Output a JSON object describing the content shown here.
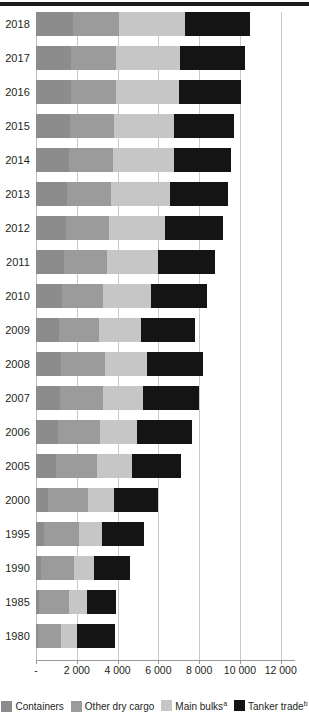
{
  "chart_data": {
    "type": "bar",
    "orientation": "horizontal",
    "stacked": true,
    "title": "",
    "subtitle": "",
    "xlabel": "",
    "ylabel": "",
    "xlim": [
      0,
      12700
    ],
    "xticks": [
      0,
      2000,
      4000,
      6000,
      8000,
      10000,
      12000
    ],
    "xticklabels": [
      "-",
      "2 000",
      "4 000",
      "6 000",
      "8 000",
      "10 000",
      "12 000"
    ],
    "grid": true,
    "legend_position": "bottom",
    "categories": [
      "2018",
      "2017",
      "2016",
      "2015",
      "2014",
      "2013",
      "2012",
      "2011",
      "2010",
      "2009",
      "2008",
      "2007",
      "2006",
      "2005",
      "2000",
      "1995",
      "1990",
      "1985",
      "1980"
    ],
    "series": [
      {
        "name": "Containers",
        "color": "#8c8c8c",
        "values": [
          1830,
          1720,
          1720,
          1660,
          1631,
          1544,
          1464,
          1393,
          1280,
          1127,
          1249,
          1193,
          1076,
          969,
          598,
          371,
          234,
          152,
          102
        ]
      },
      {
        "name": "Other dry cargo",
        "color": "#9b9b9b",
        "values": [
          2245,
          2213,
          2216,
          2170,
          2139,
          2131,
          2123,
          2112,
          2022,
          1960,
          2141,
          2112,
          2074,
          2009,
          1928,
          1754,
          1611,
          1479,
          1123
        ]
      },
      {
        "name": "Main bulks",
        "color": "#c6c6c6",
        "values": [
          3210,
          3151,
          3056,
          2951,
          2985,
          2920,
          2742,
          2477,
          2335,
          2085,
          2065,
          1953,
          1814,
          1709,
          1295,
          1105,
          988,
          857,
          796
        ]
      },
      {
        "name": "Tanker trade",
        "color": "#141414",
        "values": [
          3194,
          3146,
          3055,
          2932,
          2826,
          2828,
          2840,
          2796,
          2752,
          2642,
          2742,
          2747,
          2698,
          2422,
          2163,
          2050,
          1755,
          1459,
          1871
        ]
      }
    ],
    "totals": [
      12479,
      10230,
      10047,
      9713,
      9581,
      9423,
      9169,
      8778,
      8389,
      7814,
      8197,
      8005,
      7662,
      7109,
      5984,
      5280,
      4588,
      3947,
      3892
    ],
    "legend_notes": {
      "main_bulks_note": "a",
      "tanker_trade_note": "b"
    }
  },
  "legend": {
    "items": [
      {
        "name": "containers",
        "label": "Containers",
        "note": "",
        "color": "#8c8c8c"
      },
      {
        "name": "other-dry-cargo",
        "label": "Other dry cargo",
        "note": "",
        "color": "#9b9b9b"
      },
      {
        "name": "main-bulks",
        "label": "Main bulks",
        "note": "a",
        "color": "#c6c6c6"
      },
      {
        "name": "tanker-trade",
        "label": "Tanker trade",
        "note": "b",
        "color": "#141414"
      }
    ]
  }
}
